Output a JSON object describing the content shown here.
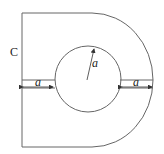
{
  "diagram": {
    "shape_label": "C",
    "radius_label": "a",
    "left_gap_label": "a",
    "right_gap_label": "a",
    "colors": {
      "stroke": "#555555",
      "text": "#222222",
      "background": "#ffffff"
    }
  }
}
